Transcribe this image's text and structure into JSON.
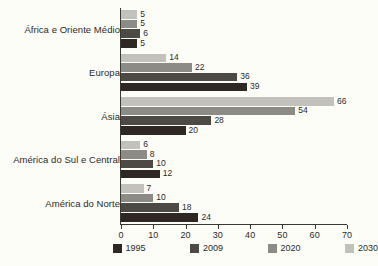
{
  "chart_data": {
    "type": "bar",
    "orientation": "horizontal",
    "title": "",
    "xlabel": "",
    "ylabel": "",
    "xlim": [
      0,
      70
    ],
    "xticks": [
      0,
      10,
      20,
      30,
      40,
      50,
      60,
      70
    ],
    "grid": false,
    "legend_position": "bottom",
    "categories": [
      "África e Oriente Médio",
      "Europa",
      "Ásia",
      "América do Sul e Central",
      "América do Norte"
    ],
    "series": [
      {
        "name": "1995",
        "color": "#2f2822",
        "values": [
          5,
          39,
          20,
          12,
          24
        ]
      },
      {
        "name": "2009",
        "color": "#4d4a45",
        "values": [
          6,
          36,
          28,
          10,
          18
        ]
      },
      {
        "name": "2020",
        "color": "#8d8b85",
        "values": [
          5,
          22,
          54,
          8,
          10
        ]
      },
      {
        "name": "2030",
        "color": "#c2c1bb",
        "values": [
          5,
          14,
          66,
          6,
          7
        ]
      }
    ]
  },
  "legend": {
    "items": [
      {
        "label": "1995"
      },
      {
        "label": "2009"
      },
      {
        "label": "2020"
      },
      {
        "label": "2030"
      }
    ]
  },
  "axis": {
    "tick_labels": [
      "0",
      "10",
      "20",
      "30",
      "40",
      "50",
      "60",
      "70"
    ]
  },
  "colors": {
    "background": "#fdfdf8",
    "axis": "#3a3832",
    "text": "#2b2a26"
  }
}
